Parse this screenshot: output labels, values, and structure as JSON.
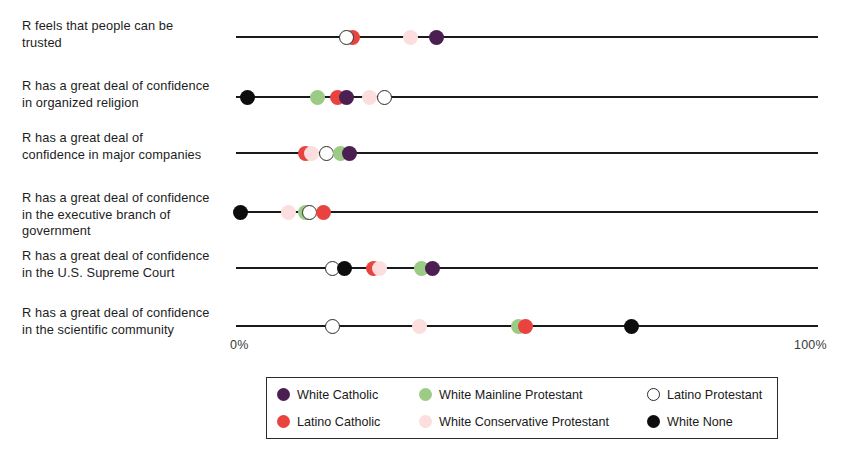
{
  "chart_data": {
    "type": "scatter",
    "title": "",
    "xlabel": "",
    "ylabel": "",
    "xlim": [
      0,
      100
    ],
    "x_tick_labels": [
      "0%",
      "100%"
    ],
    "grid": false,
    "legend_position": "bottom",
    "categories": [
      "R feels that people can be trusted",
      "R has a great deal of confidence in organized religion",
      "R has a great deal of confidence in major companies",
      "R has a great deal of confidence in the executive branch of government",
      "R has a great deal of confidence in the U.S. Supreme Court",
      "R has a great deal of confidence in the scientific community"
    ],
    "series": [
      {
        "name": "White Catholic",
        "color": "#4b1f52",
        "values": [
          34.5,
          19.0,
          19.5,
          null,
          33.7,
          null
        ]
      },
      {
        "name": "Latino Catholic",
        "color": "#e8433f",
        "values": [
          20.0,
          17.5,
          12.0,
          15.0,
          23.7,
          49.8
        ]
      },
      {
        "name": "White Mainline Protestant",
        "color": "#9ccb86",
        "values": [
          null,
          14.0,
          18.0,
          12.0,
          31.8,
          48.5
        ]
      },
      {
        "name": "White Conservative Protestant",
        "color": "#fbdedd",
        "values": [
          30.0,
          23.0,
          13.0,
          9.0,
          24.7,
          31.6
        ]
      },
      {
        "name": "Latino Protestant",
        "color": "#ffffff",
        "values": [
          19.0,
          25.5,
          15.6,
          12.7,
          16.5,
          16.5
        ]
      },
      {
        "name": "White None",
        "color": "#0d0d0d",
        "values": [
          null,
          2.0,
          null,
          0.7,
          18.7,
          68.0
        ]
      }
    ]
  },
  "rows": [
    {
      "label": "R feels that people can be\ntrusted",
      "points": [
        {
          "series": "Latino Catholic",
          "value": 20.0,
          "color": "#e8433f",
          "hollow": false
        },
        {
          "series": "Latino Protestant",
          "value": 19.0,
          "color": "#ffffff",
          "hollow": true
        },
        {
          "series": "White Conservative Protestant",
          "value": 30.0,
          "color": "#fbdedd",
          "hollow": false
        },
        {
          "series": "White Catholic",
          "value": 34.5,
          "color": "#4b1f52",
          "hollow": false
        }
      ]
    },
    {
      "label": "R has a great deal of confidence\nin organized religion",
      "points": [
        {
          "series": "White None",
          "value": 2.0,
          "color": "#0d0d0d",
          "hollow": false
        },
        {
          "series": "White Mainline Protestant",
          "value": 14.0,
          "color": "#9ccb86",
          "hollow": false
        },
        {
          "series": "Latino Catholic",
          "value": 17.5,
          "color": "#e8433f",
          "hollow": false
        },
        {
          "series": "White Catholic",
          "value": 19.0,
          "color": "#4b1f52",
          "hollow": false
        },
        {
          "series": "White Conservative Protestant",
          "value": 23.0,
          "color": "#fbdedd",
          "hollow": false
        },
        {
          "series": "Latino Protestant",
          "value": 25.5,
          "color": "#ffffff",
          "hollow": true
        }
      ]
    },
    {
      "label": "R has a great deal of\nconfidence in major companies",
      "points": [
        {
          "series": "Latino Catholic",
          "value": 12.0,
          "color": "#e8433f",
          "hollow": false
        },
        {
          "series": "White Conservative Protestant",
          "value": 13.0,
          "color": "#fbdedd",
          "hollow": false
        },
        {
          "series": "Latino Protestant",
          "value": 15.6,
          "color": "#ffffff",
          "hollow": true
        },
        {
          "series": "White Mainline Protestant",
          "value": 18.0,
          "color": "#9ccb86",
          "hollow": false
        },
        {
          "series": "White Catholic",
          "value": 19.5,
          "color": "#4b1f52",
          "hollow": false
        }
      ]
    },
    {
      "label": "R has a great deal of confidence\nin the executive branch of\ngovernment",
      "points": [
        {
          "series": "White None",
          "value": 0.7,
          "color": "#0d0d0d",
          "hollow": false
        },
        {
          "series": "White Conservative Protestant",
          "value": 9.0,
          "color": "#fbdedd",
          "hollow": false
        },
        {
          "series": "White Mainline Protestant",
          "value": 12.0,
          "color": "#9ccb86",
          "hollow": false
        },
        {
          "series": "Latino Protestant",
          "value": 12.7,
          "color": "#ffffff",
          "hollow": true
        },
        {
          "series": "Latino Catholic",
          "value": 15.0,
          "color": "#e8433f",
          "hollow": false
        }
      ]
    },
    {
      "label": "R has a great deal of confidence\nin the U.S. Supreme Court",
      "points": [
        {
          "series": "Latino Protestant",
          "value": 16.5,
          "color": "#ffffff",
          "hollow": true
        },
        {
          "series": "White None",
          "value": 18.7,
          "color": "#0d0d0d",
          "hollow": false
        },
        {
          "series": "Latino Catholic",
          "value": 23.7,
          "color": "#e8433f",
          "hollow": false
        },
        {
          "series": "White Conservative Protestant",
          "value": 24.7,
          "color": "#fbdedd",
          "hollow": false
        },
        {
          "series": "White Mainline Protestant",
          "value": 31.8,
          "color": "#9ccb86",
          "hollow": false
        },
        {
          "series": "White Catholic",
          "value": 33.7,
          "color": "#4b1f52",
          "hollow": false
        }
      ]
    },
    {
      "label": "R has a great deal of confidence\nin the scientific community",
      "points": [
        {
          "series": "Latino Protestant",
          "value": 16.5,
          "color": "#ffffff",
          "hollow": true
        },
        {
          "series": "White Conservative Protestant",
          "value": 31.6,
          "color": "#fbdedd",
          "hollow": false
        },
        {
          "series": "White Mainline Protestant",
          "value": 48.5,
          "color": "#9ccb86",
          "hollow": false
        },
        {
          "series": "Latino Catholic",
          "value": 49.8,
          "color": "#e8433f",
          "hollow": false
        },
        {
          "series": "White None",
          "value": 68.0,
          "color": "#0d0d0d",
          "hollow": false
        }
      ]
    }
  ],
  "axis": {
    "left_label": "0%",
    "right_label": "100%"
  },
  "legend": {
    "items": [
      {
        "label": "White Catholic",
        "color": "#4b1f52",
        "hollow": false
      },
      {
        "label": "White Mainline Protestant",
        "color": "#9ccb86",
        "hollow": false
      },
      {
        "label": "Latino Protestant",
        "color": "#ffffff",
        "hollow": true
      },
      {
        "label": "Latino Catholic",
        "color": "#e8433f",
        "hollow": false
      },
      {
        "label": "White Conservative Protestant",
        "color": "#fbdedd",
        "hollow": false
      },
      {
        "label": "White None",
        "color": "#0d0d0d",
        "hollow": false
      }
    ]
  }
}
